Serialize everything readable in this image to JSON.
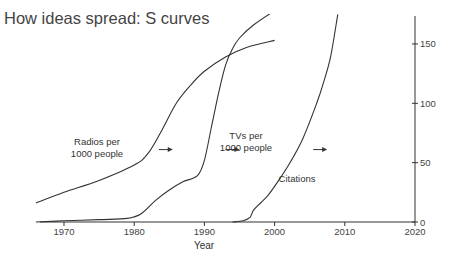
{
  "chart_data": {
    "type": "line",
    "title": "How ideas spread: S curves",
    "xlabel": "Year",
    "ylabel": "",
    "xlim": [
      1966,
      2020
    ],
    "ylim": [
      0,
      175
    ],
    "grid": false,
    "y_axis_side": "right",
    "xticks": [
      1970,
      1980,
      1990,
      2000,
      2010,
      2020
    ],
    "yticks": [
      0,
      50,
      100,
      150
    ],
    "series": [
      {
        "name": "Radios per 1000 people",
        "label_lines": [
          "Radios per",
          "1000 people"
        ],
        "points": [
          [
            1966,
            16
          ],
          [
            1970,
            25
          ],
          [
            1975,
            35
          ],
          [
            1980,
            48
          ],
          [
            1982,
            58
          ],
          [
            1984,
            78
          ],
          [
            1986,
            100
          ],
          [
            1988,
            115
          ],
          [
            1990,
            127
          ],
          [
            1993,
            139
          ],
          [
            1996,
            147
          ],
          [
            2000,
            153
          ]
        ]
      },
      {
        "name": "TVs per 1000 people",
        "label_lines": [
          "TVs per",
          "1000 people"
        ],
        "points": [
          [
            1966,
            0
          ],
          [
            1970,
            1
          ],
          [
            1975,
            2
          ],
          [
            1979,
            3
          ],
          [
            1981,
            7
          ],
          [
            1983,
            18
          ],
          [
            1985,
            27
          ],
          [
            1987,
            34
          ],
          [
            1989,
            39
          ],
          [
            1990,
            52
          ],
          [
            1991,
            80
          ],
          [
            1992,
            108
          ],
          [
            1993,
            132
          ],
          [
            1994,
            146
          ],
          [
            1995,
            155
          ],
          [
            1997,
            166
          ],
          [
            2000,
            178
          ]
        ]
      },
      {
        "name": "Citations",
        "label_lines": [
          "Citations"
        ],
        "points": [
          [
            1994,
            0
          ],
          [
            1995.5,
            1
          ],
          [
            1996.5,
            4
          ],
          [
            1997,
            10
          ],
          [
            1998,
            16
          ],
          [
            1999,
            22
          ],
          [
            2000,
            30
          ],
          [
            2002,
            48
          ],
          [
            2004,
            70
          ],
          [
            2006,
            100
          ],
          [
            2007,
            118
          ],
          [
            2008,
            140
          ],
          [
            2009,
            175
          ]
        ]
      }
    ],
    "annotations": [
      {
        "text": "arrow-right",
        "x": 1983.5,
        "y": 61
      },
      {
        "text": "arrow-right",
        "x": 1993,
        "y": 61
      },
      {
        "text": "arrow-right",
        "x": 2005.5,
        "y": 61
      }
    ]
  }
}
